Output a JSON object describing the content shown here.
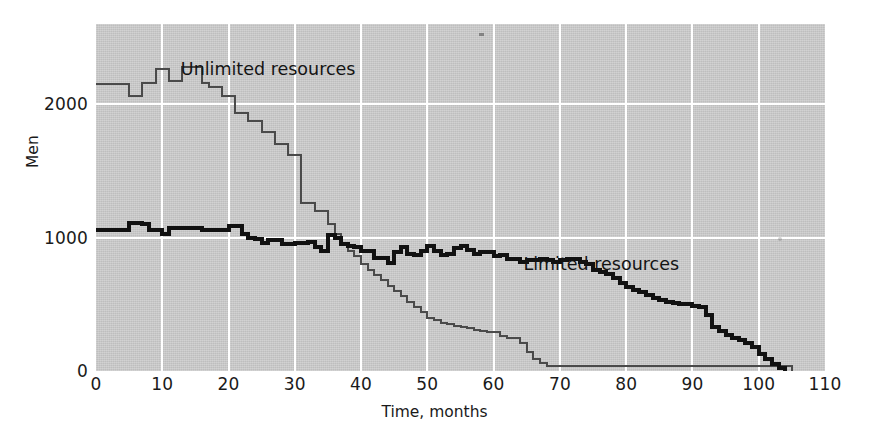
{
  "chart_data": {
    "type": "line",
    "title": "",
    "subtitle": "",
    "xlabel": "Time, months",
    "ylabel": "Men",
    "xlim": [
      0,
      110
    ],
    "ylim": [
      0,
      2600
    ],
    "xticks": [
      0,
      10,
      20,
      30,
      40,
      50,
      60,
      70,
      80,
      90,
      100,
      110
    ],
    "xticklabels": [
      "0",
      "10",
      "20",
      "30",
      "40",
      "50",
      "60",
      "70",
      "80",
      "90",
      "100",
      "110"
    ],
    "yticks": [
      0,
      1000,
      2000
    ],
    "yticklabels": [
      "0",
      "1000",
      "2000"
    ],
    "grid": "white gridlines on grey plot panel; vertical every 10 months, horizontal at 1000 and 2000",
    "legend_position": "inline annotations next to each curve",
    "interpolation": "step-post (staircase)",
    "plot_background": "#c9c9c9",
    "series": [
      {
        "name": "Unlimited resources",
        "color": "#4a4a4a",
        "linewidth": 2,
        "label_position": {
          "x_month": 12.8,
          "y_men": 2260
        },
        "x": [
          0,
          1,
          2,
          3,
          4,
          5,
          6,
          7,
          8,
          9,
          10,
          11,
          12,
          13,
          14,
          15,
          16,
          17,
          18,
          19,
          20,
          21,
          22,
          23,
          24,
          25,
          26,
          27,
          28,
          29,
          30,
          31,
          32,
          33,
          34,
          35,
          36,
          37,
          38,
          39,
          40,
          41,
          42,
          43,
          44,
          45,
          46,
          47,
          48,
          49,
          50,
          51,
          52,
          53,
          54,
          55,
          56,
          57,
          58,
          59,
          60,
          61,
          62,
          63,
          64,
          65,
          66,
          67,
          68,
          69,
          70,
          75,
          80,
          85,
          90,
          95,
          100,
          104
        ],
        "y": [
          2150,
          2150,
          2150,
          2150,
          2150,
          2060,
          2060,
          2160,
          2160,
          2260,
          2260,
          2170,
          2170,
          2280,
          2280,
          2280,
          2160,
          2130,
          2130,
          2060,
          2060,
          1930,
          1930,
          1870,
          1870,
          1790,
          1790,
          1700,
          1700,
          1620,
          1620,
          1260,
          1260,
          1200,
          1200,
          1100,
          1030,
          960,
          900,
          860,
          800,
          760,
          720,
          680,
          640,
          600,
          560,
          520,
          480,
          440,
          400,
          380,
          360,
          350,
          340,
          330,
          320,
          310,
          300,
          290,
          290,
          260,
          250,
          250,
          210,
          140,
          90,
          60,
          40,
          40,
          40,
          40,
          40,
          40,
          40,
          40,
          40,
          40
        ],
        "final_x": 105,
        "final_y": 0
      },
      {
        "name": "Limited resources",
        "color": "#111111",
        "linewidth": 4,
        "label_position": {
          "x_month": 64.5,
          "y_men": 800
        },
        "x": [
          0,
          1,
          2,
          3,
          4,
          5,
          6,
          7,
          8,
          9,
          10,
          11,
          12,
          13,
          14,
          15,
          16,
          17,
          18,
          19,
          20,
          21,
          22,
          23,
          24,
          25,
          26,
          27,
          28,
          29,
          30,
          31,
          32,
          33,
          34,
          35,
          36,
          37,
          38,
          39,
          40,
          41,
          42,
          43,
          44,
          45,
          46,
          47,
          48,
          49,
          50,
          51,
          52,
          53,
          54,
          55,
          56,
          57,
          58,
          59,
          60,
          61,
          62,
          63,
          64,
          65,
          66,
          67,
          68,
          69,
          70,
          71,
          72,
          73,
          74,
          75,
          76,
          77,
          78,
          79,
          80,
          81,
          82,
          83,
          84,
          85,
          86,
          87,
          88,
          89,
          90,
          91,
          92,
          93,
          94,
          95,
          96,
          97,
          98,
          99,
          100,
          101,
          102,
          103
        ],
        "y": [
          1060,
          1060,
          1060,
          1060,
          1060,
          1110,
          1110,
          1100,
          1060,
          1060,
          1030,
          1070,
          1070,
          1070,
          1070,
          1070,
          1060,
          1060,
          1060,
          1060,
          1090,
          1090,
          1030,
          1000,
          990,
          960,
          980,
          980,
          950,
          950,
          960,
          960,
          970,
          930,
          900,
          1020,
          1000,
          950,
          940,
          930,
          900,
          900,
          850,
          850,
          810,
          890,
          930,
          880,
          870,
          900,
          940,
          900,
          870,
          880,
          920,
          940,
          910,
          880,
          890,
          890,
          860,
          870,
          840,
          840,
          820,
          830,
          830,
          840,
          830,
          820,
          830,
          840,
          840,
          820,
          800,
          760,
          740,
          730,
          700,
          660,
          630,
          610,
          590,
          570,
          550,
          530,
          520,
          510,
          500,
          500,
          490,
          480,
          420,
          330,
          300,
          270,
          250,
          230,
          210,
          180,
          130,
          90,
          50,
          20
        ],
        "final_x": 104,
        "final_y": 0
      }
    ]
  },
  "axes": {
    "x_title": "Time, months",
    "y_title": "Men"
  },
  "annotations": {
    "unlimited": "Unlimited resources",
    "limited": "Limited resources"
  }
}
